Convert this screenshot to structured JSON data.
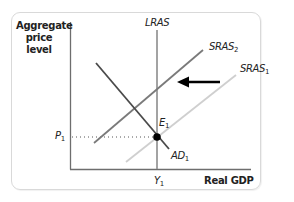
{
  "diagram": {
    "title": "",
    "y_axis_label": "Aggregate price level",
    "y_axis_label_lines": [
      "Aggregate",
      "price",
      "level"
    ],
    "x_axis_label": "Real GDP",
    "curves": {
      "lras": {
        "label": "LRAS",
        "color": "#8c8c8c"
      },
      "sras2": {
        "label": "SRAS",
        "sub": "2",
        "color": "#7a7a7a"
      },
      "sras1": {
        "label": "SRAS",
        "sub": "1",
        "color": "#cfcfcf"
      },
      "ad1": {
        "label": "AD",
        "sub": "1",
        "color": "#4a4a4a"
      }
    },
    "equilibrium": {
      "label": "E",
      "sub": "1"
    },
    "price_tick": {
      "label": "P",
      "sub": "1"
    },
    "output_tick": {
      "label": "Y",
      "sub": "1"
    },
    "shift_arrow": {
      "direction": "left",
      "meaning": "SRAS shifts from SRAS1 to SRAS2",
      "color": "#000000"
    },
    "frame_border_color": "#d9d9d9"
  }
}
